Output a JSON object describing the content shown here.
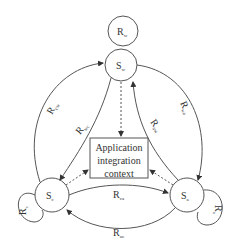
{
  "diagram": {
    "nodes": [
      {
        "id": "Sw",
        "label": "S",
        "sub": "w"
      },
      {
        "id": "Sc",
        "label": "S",
        "sub": "c"
      },
      {
        "id": "Sa",
        "label": "S",
        "sub": "a"
      }
    ],
    "context_box": {
      "lines": [
        "Application",
        "integration",
        "context"
      ]
    },
    "edges": [
      {
        "id": "Rw",
        "label": "R",
        "sub": "w",
        "from": "Sw",
        "to": "Sw"
      },
      {
        "id": "Rc",
        "label": "R",
        "sub": "c",
        "from": "Sc",
        "to": "Sc"
      },
      {
        "id": "Ra",
        "label": "R",
        "sub": "a",
        "from": "Sa",
        "to": "Sa"
      },
      {
        "id": "Rcw",
        "label": "R",
        "sub": "cw",
        "from": "Sc",
        "to": "Sw"
      },
      {
        "id": "Rwc",
        "label": "R",
        "sub": "wc",
        "from": "Sw",
        "to": "Sc"
      },
      {
        "id": "Rwa",
        "label": "R",
        "sub": "wa",
        "from": "Sw",
        "to": "Sa"
      },
      {
        "id": "Raw",
        "label": "R",
        "sub": "aw",
        "from": "Sa",
        "to": "Sw"
      },
      {
        "id": "Rca",
        "label": "R",
        "sub": "ca",
        "from": "Sc",
        "to": "Sa"
      },
      {
        "id": "Rac",
        "label": "R",
        "sub": "ac",
        "from": "Sa",
        "to": "Sc"
      }
    ]
  }
}
